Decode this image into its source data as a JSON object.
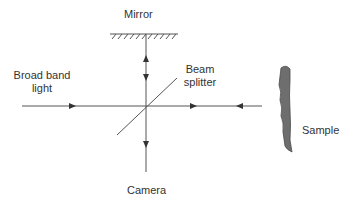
{
  "diagram": {
    "title": "",
    "labels": {
      "mirror": "Mirror",
      "source_line1": "Broad band",
      "source_line2": "light",
      "splitter_line1": "Beam",
      "splitter_line2": "splitter",
      "sample": "Sample",
      "camera": "Camera"
    },
    "colors": {
      "line": "#555555",
      "sample_fill": "#6e6e6e",
      "text": "#333333"
    },
    "components": [
      {
        "id": "mirror",
        "type": "reflector"
      },
      {
        "id": "source",
        "type": "light-source"
      },
      {
        "id": "beam-splitter",
        "type": "beam-splitter"
      },
      {
        "id": "sample",
        "type": "sample"
      },
      {
        "id": "camera",
        "type": "detector"
      }
    ],
    "edges": [
      {
        "from": "source",
        "to": "beam-splitter",
        "direction": "right"
      },
      {
        "from": "beam-splitter",
        "to": "mirror",
        "direction": "up"
      },
      {
        "from": "mirror",
        "to": "beam-splitter",
        "direction": "down"
      },
      {
        "from": "beam-splitter",
        "to": "sample",
        "direction": "right"
      },
      {
        "from": "sample",
        "to": "beam-splitter",
        "direction": "left"
      },
      {
        "from": "beam-splitter",
        "to": "camera",
        "direction": "down"
      }
    ]
  }
}
